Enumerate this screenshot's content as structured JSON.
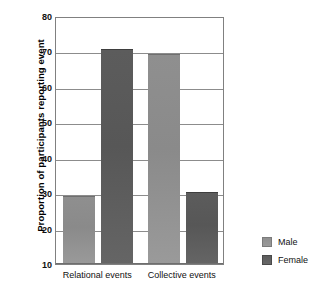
{
  "chart_data": {
    "type": "bar",
    "title": "",
    "xlabel": "",
    "ylabel": "Proportion of participants reporting event",
    "categories": [
      "Relational events",
      "Collective events"
    ],
    "series": [
      {
        "name": "Male",
        "color": "#8a8a8a",
        "values": [
          29,
          69
        ]
      },
      {
        "name": "Female",
        "color": "#575757",
        "values": [
          70.5,
          30
        ]
      }
    ],
    "ylim": [
      10,
      80
    ],
    "yticks": [
      10,
      20,
      30,
      40,
      50,
      60,
      70,
      80
    ],
    "ytick_labels": [
      "10",
      "20",
      "30",
      "40",
      "50",
      "60",
      "70",
      "80"
    ],
    "grid": true,
    "legend_position": "right"
  },
  "legend": {
    "entries": [
      {
        "label": "Male",
        "swatch": "male-swatch"
      },
      {
        "label": "Female",
        "swatch": "female-swatch"
      }
    ]
  }
}
